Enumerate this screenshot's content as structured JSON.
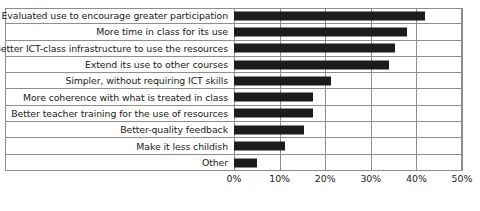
{
  "chart_data": {
    "type": "bar",
    "orientation": "horizontal",
    "title": "",
    "xlabel": "",
    "ylabel": "",
    "xlim": [
      0,
      50
    ],
    "xtick_labels": [
      "0%",
      "10%",
      "20%",
      "30%",
      "40%",
      "50%"
    ],
    "xticks": [
      0,
      10,
      20,
      30,
      40,
      50
    ],
    "grid": "vertical",
    "legend": "none",
    "bar_color": "#1c1c1c",
    "categories": [
      "Evaluated use to encourage greater participation",
      "More time in class for its use",
      "Better ICT-class infrastructure to use the resources",
      "Extend its use to other courses",
      "Simpler, without requiring ICT skills",
      "More coherence with what is treated in class",
      "Better teacher training for the use of resources",
      "Better-quality feedback",
      "Make it less childish",
      "Other"
    ],
    "values": [
      41.8,
      38.0,
      35.2,
      34.0,
      21.2,
      17.3,
      17.3,
      15.3,
      11.2,
      5.0
    ]
  }
}
